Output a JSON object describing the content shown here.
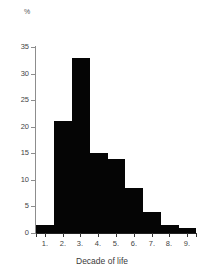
{
  "chart_data": {
    "type": "bar",
    "title": "",
    "subtitle": "",
    "xlabel": "Decade of life",
    "ylabel": "%",
    "y_unit_label": "%",
    "categories": [
      "1.",
      "2.",
      "3.",
      "4.",
      "5.",
      "6.",
      "7.",
      "8.",
      "9."
    ],
    "values": [
      1.5,
      21,
      33,
      15,
      14,
      8.5,
      4,
      1.5,
      1
    ],
    "series": [
      {
        "name": "Percentage of cases",
        "values": [
          1.5,
          21,
          33,
          15,
          14,
          8.5,
          4,
          1.5,
          1
        ]
      }
    ],
    "ylim": [
      0,
      35
    ],
    "yticks": [
      0,
      5,
      10,
      15,
      20,
      25,
      30,
      35
    ],
    "ytick_labels": [
      "0",
      "5",
      "10",
      "15",
      "20",
      "25",
      "30",
      "35"
    ],
    "xtick_labels": [
      "1.",
      "2.",
      "3.",
      "4.",
      "5.",
      "6.",
      "7.",
      "8.",
      "9."
    ],
    "grid": false,
    "legend": false,
    "legend_position": "none",
    "bar_color": "#050505",
    "axis_color": "#8d8d8d",
    "text_color": "#444444",
    "background_color": "#ffffff",
    "bar_style": "histogram-contiguous"
  }
}
